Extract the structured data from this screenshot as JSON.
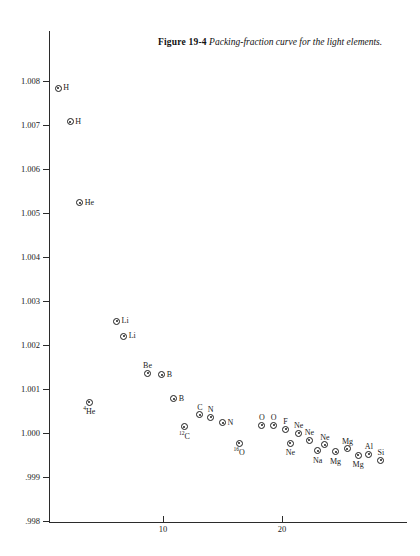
{
  "caption": {
    "label": "Figure 19-4",
    "text": "Packing-fraction curve for the light elements."
  },
  "chart_data": {
    "type": "scatter",
    "title": "Packing-fraction curve for the light elements",
    "xlabel": "",
    "ylabel": "",
    "xlim": [
      0,
      30.5
    ],
    "ylim": [
      0.998,
      1.0082
    ],
    "grid": false,
    "legend": null,
    "xticks": [
      10,
      20
    ],
    "xtick_labels": [
      "10",
      "20"
    ],
    "yticks": [
      0.998,
      0.999,
      1.0,
      1.001,
      1.002,
      1.003,
      1.004,
      1.005,
      1.006,
      1.007,
      1.008
    ],
    "ytick_labels": [
      ".998",
      ".999",
      "1.000",
      "1.001",
      "1.002",
      "1.003",
      "1.004",
      "1.005",
      "1.006",
      "1.007",
      "1.008"
    ],
    "points": [
      {
        "label": "H",
        "sup": "",
        "x": 1.2,
        "y": 1.00784,
        "pos": "r"
      },
      {
        "label": "H",
        "sup": "",
        "x": 2.2,
        "y": 1.00707,
        "pos": "r"
      },
      {
        "label": "He",
        "sup": "",
        "x": 3.0,
        "y": 1.00523,
        "pos": "r"
      },
      {
        "label": "Li",
        "sup": "",
        "x": 6.1,
        "y": 1.00254,
        "pos": "r"
      },
      {
        "label": "Li",
        "sup": "",
        "x": 6.7,
        "y": 1.0022,
        "pos": "r"
      },
      {
        "label": "He",
        "sup": "4",
        "x": 3.8,
        "y": 1.0007,
        "pos": "b"
      },
      {
        "label": "Be",
        "sup": "",
        "x": 8.7,
        "y": 1.00136,
        "pos": "t"
      },
      {
        "label": "B",
        "sup": "",
        "x": 9.9,
        "y": 1.00132,
        "pos": "r"
      },
      {
        "label": "B",
        "sup": "",
        "x": 10.9,
        "y": 1.00078,
        "pos": "r"
      },
      {
        "label": "C",
        "sup": "12",
        "x": 11.8,
        "y": 1.00014,
        "pos": "b"
      },
      {
        "label": "C",
        "sup": "",
        "x": 13.1,
        "y": 1.00042,
        "pos": "t"
      },
      {
        "label": "N",
        "sup": "",
        "x": 14.0,
        "y": 1.00036,
        "pos": "t"
      },
      {
        "label": "N",
        "sup": "",
        "x": 15.0,
        "y": 1.00023,
        "pos": "r"
      },
      {
        "label": "O",
        "sup": "16",
        "x": 16.4,
        "y": 0.99977,
        "pos": "b"
      },
      {
        "label": "O",
        "sup": "",
        "x": 18.3,
        "y": 1.00018,
        "pos": "t"
      },
      {
        "label": "O",
        "sup": "",
        "x": 19.3,
        "y": 1.00018,
        "pos": "t"
      },
      {
        "label": "F",
        "sup": "",
        "x": 20.3,
        "y": 1.00008,
        "pos": "t"
      },
      {
        "label": "Ne",
        "sup": "",
        "x": 21.4,
        "y": 1.0,
        "pos": "t"
      },
      {
        "label": "Ne",
        "sup": "",
        "x": 20.7,
        "y": 0.99977,
        "pos": "b"
      },
      {
        "label": "Ne",
        "sup": "",
        "x": 22.3,
        "y": 0.99984,
        "pos": "t"
      },
      {
        "label": "Ne",
        "sup": "",
        "x": 23.6,
        "y": 0.99973,
        "pos": "t"
      },
      {
        "label": "Na",
        "sup": "",
        "x": 23.0,
        "y": 0.9996,
        "pos": "b"
      },
      {
        "label": "Mg",
        "sup": "",
        "x": 24.5,
        "y": 0.99957,
        "pos": "b"
      },
      {
        "label": "Mg",
        "sup": "",
        "x": 25.5,
        "y": 0.99964,
        "pos": "t"
      },
      {
        "label": "Mg",
        "sup": "",
        "x": 26.4,
        "y": 0.9995,
        "pos": "b"
      },
      {
        "label": "Al",
        "sup": "",
        "x": 27.3,
        "y": 0.99952,
        "pos": "t"
      },
      {
        "label": "Si",
        "sup": "",
        "x": 28.3,
        "y": 0.99938,
        "pos": "t"
      }
    ]
  }
}
